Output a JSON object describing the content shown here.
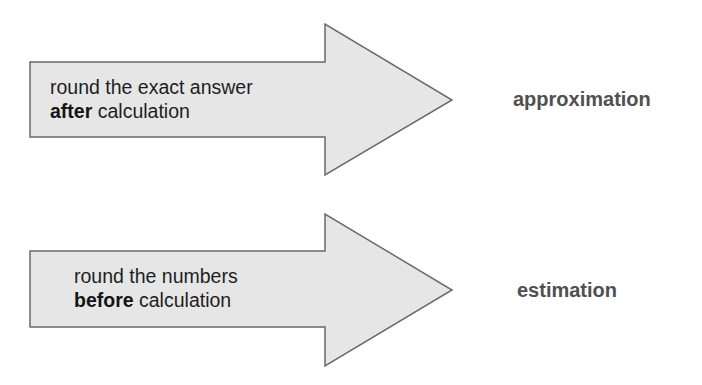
{
  "colors": {
    "arrow_fill": "#e6e6e6",
    "arrow_stroke": "#6a6a6a",
    "label": "#505050",
    "text": "#1e1e1e"
  },
  "rows": [
    {
      "line1": "round the exact answer",
      "bold": "after",
      "rest": " calculation",
      "result": "approximation"
    },
    {
      "line1": "round the numbers",
      "bold": "before",
      "rest": " calculation",
      "result": "estimation"
    }
  ]
}
